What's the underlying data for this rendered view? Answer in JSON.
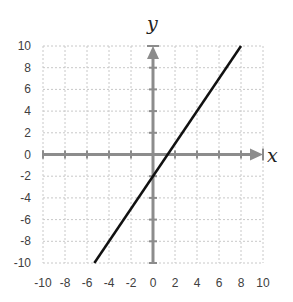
{
  "chart_data": {
    "type": "line",
    "title": "",
    "xlabel": "x",
    "ylabel": "y",
    "xlim": [
      -10,
      10
    ],
    "ylim": [
      -10,
      10
    ],
    "grid": true,
    "x_ticks": [
      -10,
      -8,
      -6,
      -4,
      -2,
      0,
      2,
      4,
      6,
      8,
      10
    ],
    "y_ticks": [
      -10,
      -8,
      -6,
      -4,
      -2,
      0,
      2,
      4,
      6,
      8,
      10
    ],
    "series": [
      {
        "name": "y = 1.5x - 2",
        "equation": "y = 1.5x - 2",
        "x": [
          -5.333,
          8
        ],
        "y": [
          -10,
          10
        ],
        "color": "#111111"
      }
    ],
    "axes_arrows": {
      "x_positive": true,
      "y_positive": true
    },
    "colors": {
      "axis": "#8c8c8c",
      "grid": "#c8c8c8",
      "line": "#111111",
      "labels": "#404040"
    }
  }
}
